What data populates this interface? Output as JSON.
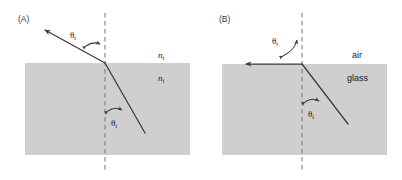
{
  "figure": {
    "type": "optics-refraction-diagram",
    "width": 402,
    "height": 180,
    "background_color": "#ffffff",
    "medium_fill_color": "#cfcfcf",
    "ray_color": "#3a3a3a",
    "dashed_normal_color": "#7a7a7a"
  },
  "panels": [
    {
      "id": "A",
      "label": "(A)",
      "label_x": 18,
      "label_y": 22,
      "slab": {
        "x": 25,
        "y": 63,
        "width": 165,
        "height": 92
      },
      "normal": {
        "x": 105,
        "y1": 13,
        "y2": 172
      },
      "interface_y": 63,
      "incident_ray": {
        "description": "ray travelling upward-left out of the dense medium",
        "from_x": 145,
        "from_y": 133,
        "to_x": 105,
        "to_y": 63
      },
      "transmitted_ray": {
        "description": "refracted ray bent away from the normal, arrowhead up-left",
        "from_x": 105,
        "from_y": 63,
        "to_x": 42,
        "to_y": 28,
        "arrowhead": "up-left"
      },
      "angles": [
        {
          "name": "theta-t",
          "symbol": "θ",
          "subscript": "t",
          "label_x": 72,
          "label_y": 34,
          "side": "above-interface",
          "arc_marker": "double-headed curved arrow"
        },
        {
          "name": "theta-i",
          "symbol": "θ",
          "subscript": "i",
          "label_x": 117,
          "label_y": 122,
          "side": "below-interface",
          "arc_marker": "double-headed curved arrow"
        }
      ],
      "media": [
        {
          "name": "n-transmitted",
          "symbol": "n",
          "subscript": "t",
          "x": 160,
          "y": 58,
          "region": "upper"
        },
        {
          "name": "n-incident",
          "symbol": "n",
          "subscript": "i",
          "x": 160,
          "y": 80,
          "region": "lower"
        }
      ]
    },
    {
      "id": "B",
      "label": "(B)",
      "label_x": 219,
      "label_y": 22,
      "slab": {
        "x": 222,
        "y": 64,
        "width": 165,
        "height": 91
      },
      "normal": {
        "x": 302,
        "y1": 13,
        "y2": 172
      },
      "interface_y": 64,
      "incident_ray": {
        "description": "ray travelling upward-left at the critical angle",
        "from_x": 348,
        "from_y": 124,
        "to_x": 302,
        "to_y": 64
      },
      "transmitted_ray": {
        "description": "refracted ray grazing along the interface, arrowhead pointing left",
        "from_x": 302,
        "from_y": 64,
        "to_x": 243,
        "to_y": 64,
        "arrowhead": "left"
      },
      "angles": [
        {
          "name": "theta-t",
          "symbol": "θ",
          "subscript": "t",
          "label_x": 278,
          "label_y": 41,
          "side": "above-interface",
          "arc_marker": "double-headed curved arrow, 90 degrees"
        },
        {
          "name": "theta-i",
          "symbol": "θ",
          "subscript": "i",
          "label_x": 317,
          "label_y": 113,
          "side": "below-interface",
          "arc_marker": "double-headed curved arrow"
        }
      ],
      "media": [
        {
          "name": "air",
          "symbol": "air",
          "x": 355,
          "y": 57,
          "region": "upper"
        },
        {
          "name": "glass",
          "symbol": "glass",
          "x": 350,
          "y": 79,
          "region": "lower"
        }
      ]
    }
  ]
}
